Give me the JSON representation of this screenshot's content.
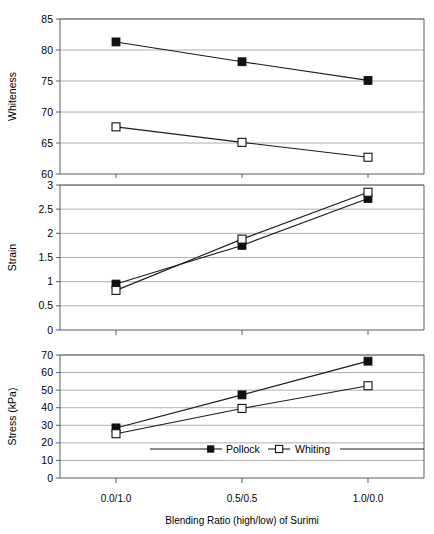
{
  "figure": {
    "background": "#ffffff",
    "line_color": "#1a1a1a",
    "grid_color": "#9a9a9a",
    "axis_color": "#4d4d4d"
  },
  "legend": {
    "position": "bottom-panel-inside",
    "entries": [
      {
        "label": "Pollock",
        "marker": "filled-square",
        "color": "#111111"
      },
      {
        "label": "Whiting",
        "marker": "open-square",
        "color": "#111111"
      }
    ]
  },
  "xaxis": {
    "title": "Blending Ratio (high/low) of Surimi",
    "tick_labels": [
      "0.0/1.0",
      "0.5/0.5",
      "1.0/0.0"
    ]
  },
  "chart_data": [
    {
      "type": "line",
      "title": "",
      "xlabel": "Blending Ratio (high/low) of Surimi",
      "ylabel": "Whiteness",
      "categories": [
        "0.0/1.0",
        "0.5/0.5",
        "1.0/0.0"
      ],
      "ylim": [
        60,
        85
      ],
      "yticks": [
        60,
        65,
        70,
        75,
        80,
        85
      ],
      "ytick_labels": [
        "60",
        "65",
        "70",
        "75",
        "80",
        "85"
      ],
      "grid": true,
      "legend": [
        "Pollock",
        "Whiting"
      ],
      "series": [
        {
          "name": "Pollock",
          "marker": "filled-square",
          "values": [
            81.3,
            78.1,
            75.1
          ]
        },
        {
          "name": "Whiting",
          "marker": "open-square",
          "values": [
            67.6,
            65.1,
            62.7
          ]
        }
      ]
    },
    {
      "type": "line",
      "title": "",
      "xlabel": "Blending Ratio (high/low) of Surimi",
      "ylabel": "Strain",
      "categories": [
        "0.0/1.0",
        "0.5/0.5",
        "1.0/0.0"
      ],
      "ylim": [
        0,
        3
      ],
      "yticks": [
        0,
        0.5,
        1,
        1.5,
        2,
        2.5,
        3
      ],
      "ytick_labels": [
        "0",
        "0.5",
        "1",
        "1.5",
        "2",
        "2.5",
        "3"
      ],
      "grid": true,
      "legend": [
        "Pollock",
        "Whiting"
      ],
      "series": [
        {
          "name": "Pollock",
          "marker": "filled-square",
          "values": [
            0.95,
            1.75,
            2.72
          ]
        },
        {
          "name": "Whiting",
          "marker": "open-square",
          "values": [
            0.82,
            1.88,
            2.85
          ]
        }
      ]
    },
    {
      "type": "line",
      "title": "",
      "xlabel": "Blending Ratio (high/low) of Surimi",
      "ylabel": "Stress (kPa)",
      "categories": [
        "0.0/1.0",
        "0.5/0.5",
        "1.0/0.0"
      ],
      "ylim": [
        0,
        70
      ],
      "yticks": [
        0,
        10,
        20,
        30,
        40,
        50,
        60,
        70
      ],
      "ytick_labels": [
        "0",
        "10",
        "20",
        "30",
        "40",
        "50",
        "60",
        "70"
      ],
      "grid": true,
      "legend": [
        "Pollock",
        "Whiting"
      ],
      "series": [
        {
          "name": "Pollock",
          "marker": "filled-square",
          "values": [
            28.5,
            47.3,
            66.5
          ]
        },
        {
          "name": "Whiting",
          "marker": "open-square",
          "values": [
            25.2,
            39.6,
            52.5
          ]
        }
      ]
    }
  ]
}
